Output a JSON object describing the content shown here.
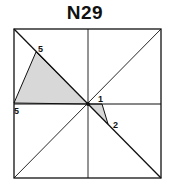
{
  "title": "N29",
  "diagram": {
    "square": {
      "x": 14,
      "y": 29,
      "w": 147,
      "h": 149
    },
    "center": [
      88,
      104
    ],
    "shaded_triangles": [
      {
        "points": [
          [
            36,
            52
          ],
          [
            14,
            103
          ],
          [
            88,
            104
          ]
        ],
        "fill": "#d8d8d8"
      },
      {
        "points": [
          [
            88,
            104
          ],
          [
            102,
            104
          ],
          [
            108,
            124
          ]
        ],
        "fill": "#d8d8d8"
      }
    ],
    "labels": [
      {
        "text": "5",
        "x": 38,
        "y": 52
      },
      {
        "text": "5",
        "x": 14,
        "y": 114
      },
      {
        "text": "1",
        "x": 98,
        "y": 102
      },
      {
        "text": "2",
        "x": 113,
        "y": 128
      }
    ],
    "line_color": "#111111"
  }
}
